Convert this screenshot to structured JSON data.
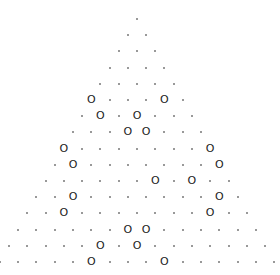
{
  "grid": {
    "center_x": 137,
    "top_y": 19,
    "dx": 18.3,
    "dy": 16.2
  },
  "symbols": {
    "dot": ".",
    "ring": "O"
  },
  "rows": [
    ".",
    "..",
    "...",
    "....",
    ".....",
    "O...O.",
    ".O.O...",
    "...OO...",
    "O.......O",
    ".O.......O",
    "......O.O..",
    "..O.......O.",
    "..O.......O..",
    "......OO......",
    ".....O.O.......",
    ".....O...O......"
  ]
}
